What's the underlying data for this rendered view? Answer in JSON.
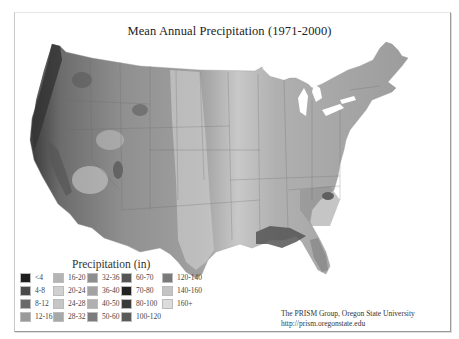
{
  "title": "Mean Annual Precipitation (1971-2000)",
  "legend": {
    "title": "Precipitation (in)",
    "items": [
      {
        "label": "<4",
        "color": "#1e1e1e"
      },
      {
        "label": "4-8",
        "color": "#4a4a4a"
      },
      {
        "label": "8-12",
        "color": "#6a6a6a"
      },
      {
        "label": "12-16",
        "color": "#9a9a9a"
      },
      {
        "label": "16-20",
        "color": "#b4b4b4"
      },
      {
        "label": "20-24",
        "color": "#d0d0d0"
      },
      {
        "label": "24-28",
        "color": "#c6c6c6"
      },
      {
        "label": "28-32",
        "color": "#a8a8a8"
      },
      {
        "label": "32-36",
        "color": "#8e8e8e"
      },
      {
        "label": "36-40",
        "color": "#a2a2a2"
      },
      {
        "label": "40-50",
        "color": "#b0b0b0"
      },
      {
        "label": "50-60",
        "color": "#7c7c7c"
      },
      {
        "label": "60-70",
        "color": "#545454"
      },
      {
        "label": "70-80",
        "color": "#222222"
      },
      {
        "label": "80-100",
        "color": "#3a3a3a"
      },
      {
        "label": "100-120",
        "color": "#5a5a5a"
      },
      {
        "label": "120-140",
        "color": "#7a7a7a"
      },
      {
        "label": "140-160",
        "color": "#c4c4c4"
      },
      {
        "label": "160+",
        "color": "#dcdcdc"
      }
    ]
  },
  "credit": {
    "line1": "The PRISM Group, Oregon State University",
    "line2": "http://prism.oregonstate.edu"
  }
}
